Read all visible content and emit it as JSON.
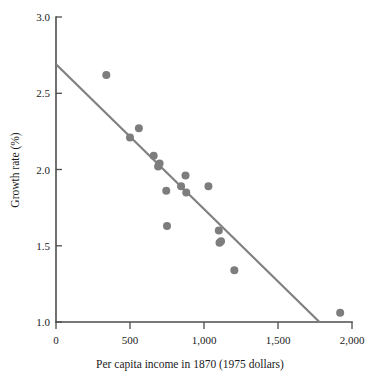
{
  "chart_data": {
    "type": "scatter",
    "title": "",
    "xlabel": "Per capita income in 1870 (1975 dollars)",
    "ylabel": "Growth rate (%)",
    "xlim": [
      0,
      2000
    ],
    "ylim": [
      1.0,
      3.0
    ],
    "grid": false,
    "legend": "none",
    "xticks": [
      0,
      500,
      1000,
      1500,
      2000
    ],
    "xtick_labels": [
      "0",
      "500",
      "1,000",
      "1,500",
      "2,000"
    ],
    "yticks": [
      1.0,
      1.5,
      2.0,
      2.5,
      3.0
    ],
    "ytick_labels": [
      "1.0",
      "1.5",
      "2.0",
      "2.5",
      "3.0"
    ],
    "marker_color": "#7d7d7d",
    "marker_size": 5,
    "points": [
      {
        "x": 340,
        "y": 2.62
      },
      {
        "x": 500,
        "y": 2.21
      },
      {
        "x": 560,
        "y": 2.27
      },
      {
        "x": 660,
        "y": 2.09
      },
      {
        "x": 690,
        "y": 2.02
      },
      {
        "x": 700,
        "y": 2.04
      },
      {
        "x": 745,
        "y": 1.86
      },
      {
        "x": 750,
        "y": 1.63
      },
      {
        "x": 845,
        "y": 1.89
      },
      {
        "x": 875,
        "y": 1.96
      },
      {
        "x": 880,
        "y": 1.85
      },
      {
        "x": 1030,
        "y": 1.89
      },
      {
        "x": 1100,
        "y": 1.6
      },
      {
        "x": 1105,
        "y": 1.52
      },
      {
        "x": 1115,
        "y": 1.53
      },
      {
        "x": 1205,
        "y": 1.34
      },
      {
        "x": 1920,
        "y": 1.06
      }
    ],
    "trend_line": {
      "color": "#808080",
      "x_start": 0,
      "y_start": 2.69,
      "x_end": 1780,
      "y_end": 1.0
    }
  }
}
